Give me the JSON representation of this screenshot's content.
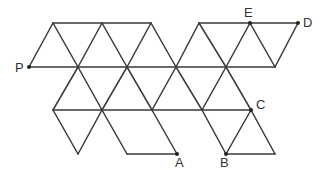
{
  "diagram": {
    "type": "triangular-grid-net",
    "labels": [
      {
        "id": "P",
        "text": "P",
        "x": 15,
        "y": 72,
        "point": [
          29,
          67
        ]
      },
      {
        "id": "E",
        "text": "E",
        "x": 244,
        "y": 17,
        "point": [
          250,
          23
        ]
      },
      {
        "id": "D",
        "text": "D",
        "x": 303,
        "y": 27,
        "point": [
          298,
          23
        ]
      },
      {
        "id": "C",
        "text": "C",
        "x": 256,
        "y": 109,
        "point": [
          251,
          110
        ]
      },
      {
        "id": "A",
        "text": "A",
        "x": 175,
        "y": 167,
        "point": [
          177,
          154
        ]
      },
      {
        "id": "B",
        "text": "B",
        "x": 220,
        "y": 167,
        "point": [
          226,
          154
        ]
      }
    ],
    "segments": [
      [
        53,
        23,
        151,
        23
      ],
      [
        199,
        23,
        298,
        23
      ],
      [
        29,
        67,
        275,
        67
      ],
      [
        53,
        110,
        251,
        110
      ],
      [
        127,
        154,
        177,
        154
      ],
      [
        226,
        154,
        275,
        154
      ],
      [
        29,
        67,
        53,
        23
      ],
      [
        53,
        23,
        78,
        67
      ],
      [
        78,
        67,
        102,
        23
      ],
      [
        102,
        23,
        127,
        67
      ],
      [
        127,
        67,
        151,
        23
      ],
      [
        151,
        23,
        176,
        67
      ],
      [
        176,
        67,
        199,
        23
      ],
      [
        199,
        23,
        226,
        67
      ],
      [
        226,
        67,
        250,
        23
      ],
      [
        250,
        23,
        275,
        67
      ],
      [
        275,
        67,
        298,
        23
      ],
      [
        78,
        67,
        53,
        110
      ],
      [
        78,
        67,
        102,
        110
      ],
      [
        127,
        67,
        102,
        110
      ],
      [
        127,
        67,
        152,
        110
      ],
      [
        176,
        67,
        152,
        110
      ],
      [
        176,
        67,
        202,
        110
      ],
      [
        226,
        67,
        202,
        110
      ],
      [
        226,
        67,
        251,
        110
      ],
      [
        53,
        110,
        78,
        154
      ],
      [
        102,
        110,
        78,
        154
      ],
      [
        102,
        110,
        127,
        154
      ],
      [
        152,
        110,
        177,
        154
      ],
      [
        202,
        110,
        226,
        154
      ],
      [
        251,
        110,
        226,
        154
      ],
      [
        251,
        110,
        275,
        154
      ]
    ]
  }
}
